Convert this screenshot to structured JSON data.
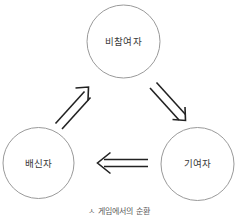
{
  "figure": {
    "background_color": "#ffffff",
    "circle_stroke_color": "#9a9a9a",
    "arrow_color": "#222222",
    "label_color": "#3a3a3a",
    "caption": "ㅅ 게임에서의 순환"
  },
  "nodes": [
    {
      "id": "nonparticipant",
      "label": "비참여자",
      "position": "top"
    },
    {
      "id": "betrayer",
      "label": "배신자",
      "position": "bottom-left"
    },
    {
      "id": "contributor",
      "label": "기여자",
      "position": "bottom-right"
    }
  ],
  "arrows": [
    {
      "id": "betrayer-to-nonparticipant",
      "from": "배신자",
      "to": "비참여자",
      "direction": "up-right",
      "style": "hollow-double-line"
    },
    {
      "id": "nonparticipant-to-contributor",
      "from": "비참여자",
      "to": "기여자",
      "direction": "down-right",
      "style": "hollow-double-line"
    },
    {
      "id": "contributor-to-betrayer",
      "from": "기여자",
      "to": "배신자",
      "direction": "left",
      "style": "hollow-double-line"
    }
  ]
}
